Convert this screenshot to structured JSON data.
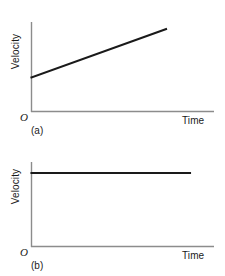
{
  "figure": {
    "background": "#ffffff",
    "axis_color": "#8c8c8c",
    "data_line_color": "#1a1a1a"
  },
  "panel_a": {
    "caption": "(a)",
    "ylabel": "Velocity",
    "xlabel": "Time",
    "origin": "O"
  },
  "panel_b": {
    "caption": "(b)",
    "ylabel": "Velocity",
    "xlabel": "Time",
    "origin": "O"
  },
  "chart_data": [
    {
      "type": "line",
      "title": "(a)",
      "xlabel": "Time",
      "ylabel": "Velocity",
      "origin_label": "O",
      "description": "Velocity increases linearly with time (constant positive acceleration).",
      "grid": false,
      "legend": null,
      "axis_ticks": [],
      "xlim": [
        0,
        1
      ],
      "ylim": [
        0,
        1
      ],
      "series": [
        {
          "name": "velocity",
          "x": [
            0.0,
            1.0
          ],
          "y": [
            0.38,
            0.92
          ]
        }
      ]
    },
    {
      "type": "line",
      "title": "(b)",
      "xlabel": "Time",
      "ylabel": "Velocity",
      "origin_label": "O",
      "description": "Velocity stays constant with time (zero acceleration).",
      "grid": false,
      "legend": null,
      "axis_ticks": [],
      "xlim": [
        0,
        1
      ],
      "ylim": [
        0,
        1
      ],
      "series": [
        {
          "name": "velocity",
          "x": [
            0.0,
            1.0
          ],
          "y": [
            0.87,
            0.87
          ]
        }
      ]
    }
  ]
}
